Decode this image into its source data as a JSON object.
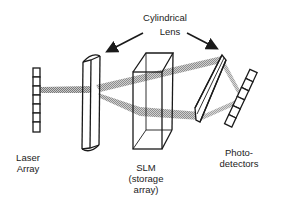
{
  "diagram": {
    "title_label": {
      "line1": "Cylindrical",
      "line2": "Lens"
    },
    "components": [
      {
        "id": "laser-array",
        "line1": "Laser",
        "line2": "Array"
      },
      {
        "id": "slm",
        "line1": "SLM",
        "line2": "(storage",
        "line3": "array)"
      },
      {
        "id": "photodetectors",
        "line1": "Photo-",
        "line2": "detectors"
      }
    ],
    "colors": {
      "stroke": "#1a1a1a",
      "beam": "#9a9a9a",
      "background": "#ffffff"
    },
    "laser_array_elements": 7,
    "photodetector_elements": 6
  }
}
